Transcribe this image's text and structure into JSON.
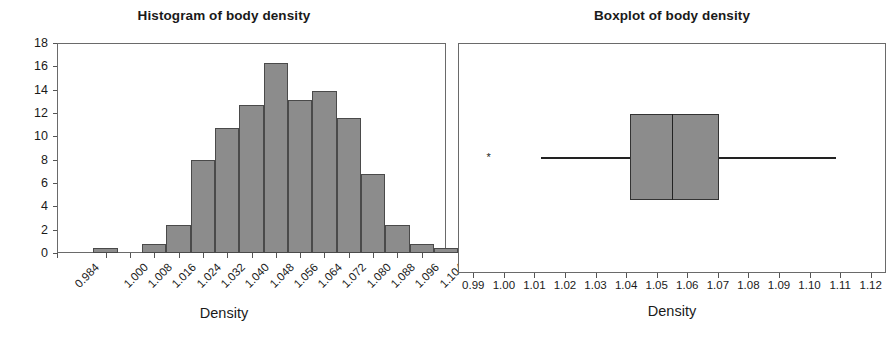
{
  "chart_data": [
    {
      "type": "bar",
      "title": "Histogram of body density",
      "xlabel": "Density",
      "ylabel": "Percent",
      "ylim": [
        0,
        18
      ],
      "ytick_values": [
        0,
        2,
        4,
        6,
        8,
        10,
        12,
        14,
        16,
        18
      ],
      "ytick_labels": [
        "0",
        "2",
        "4",
        "6",
        "8",
        "10",
        "12",
        "14",
        "16",
        "18"
      ],
      "categories": [
        "0.984",
        "1.000",
        "1.008",
        "1.016",
        "1.024",
        "1.032",
        "1.040",
        "1.048",
        "1.056",
        "1.064",
        "1.072",
        "1.080",
        "1.088",
        "1.096",
        "1.104"
      ],
      "xtick_labels": [
        "0.984",
        "1.000",
        "1.008",
        "1.016",
        "1.024",
        "1.032",
        "1.040",
        "1.048",
        "1.056",
        "1.064",
        "1.072",
        "1.080",
        "1.088",
        "1.096",
        "1.104"
      ],
      "bin_width": 0.008,
      "bin_left_edges": [
        0.996,
        1.012,
        1.02,
        1.028,
        1.036,
        1.044,
        1.052,
        1.06,
        1.068,
        1.076,
        1.084,
        1.092,
        1.1,
        1.108
      ],
      "values": [
        0.4,
        0.8,
        2.4,
        8.0,
        10.7,
        12.7,
        16.3,
        13.1,
        13.9,
        11.6,
        6.8,
        2.4,
        0.8,
        0.4
      ],
      "grid": false,
      "legend": "none",
      "bar_fill": "#8c8c8c",
      "bar_edge": "#4a4a4a"
    },
    {
      "type": "boxplot",
      "title": "Boxplot of body density",
      "xlabel": "Density",
      "xlim": [
        0.985,
        1.125
      ],
      "xtick_labels": [
        "0.99",
        "1.00",
        "1.01",
        "1.02",
        "1.03",
        "1.04",
        "1.05",
        "1.06",
        "1.07",
        "1.08",
        "1.09",
        "1.10",
        "1.11",
        "1.12"
      ],
      "xtick_values": [
        0.99,
        1.0,
        1.01,
        1.02,
        1.03,
        1.04,
        1.05,
        1.06,
        1.07,
        1.08,
        1.09,
        1.1,
        1.11,
        1.12
      ],
      "box": {
        "q1": 1.0414,
        "median": 1.0549,
        "q3": 1.0703,
        "whisker_low": 1.0122,
        "whisker_high": 1.1088
      },
      "outliers": [
        0.995
      ],
      "outlier_marker": "asterisk",
      "orientation": "horizontal",
      "grid": false,
      "legend": "none",
      "box_fill": "#8c8c8c",
      "box_edge": "#333333"
    }
  ]
}
